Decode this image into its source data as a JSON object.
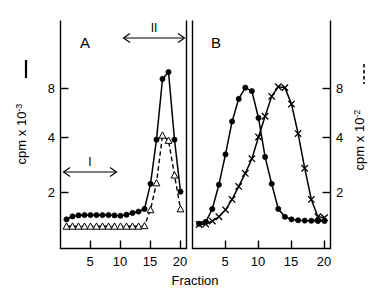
{
  "figure": {
    "x_axis_label": "Fraction",
    "left_y_axis_label": "cpm x 10",
    "left_y_axis_exponent": "-3",
    "right_y_axis_label": "cpm x 10",
    "right_y_axis_exponent": "-2",
    "panel_a_label": "A",
    "panel_b_label": "B",
    "region_i_label": "I",
    "region_ii_label": "II"
  },
  "axis_ticks": {
    "x_labels": [
      "5",
      "10",
      "15",
      "20"
    ],
    "x_values": [
      5,
      10,
      15,
      20
    ],
    "left_y_labels": [
      "2",
      "4",
      "8"
    ],
    "left_y_values": [
      2,
      4,
      8
    ],
    "right_y_labels": [
      "2",
      "4",
      "8"
    ],
    "right_y_values": [
      2,
      4,
      8
    ]
  },
  "chart_data": [
    {
      "type": "line",
      "title": "A",
      "xlabel": "Fraction",
      "ylabel": "cpm x 10^-3",
      "xlim": [
        1,
        21
      ],
      "ylim": [
        0,
        10
      ],
      "grid": false,
      "legend": "none",
      "annotations": [
        {
          "label": "I",
          "type": "double-arrow",
          "x_start": 1,
          "x_end": 10,
          "y": 2.6
        },
        {
          "label": "II",
          "type": "double-arrow",
          "x_start": 14.5,
          "x_end": 21,
          "y": 9.7
        }
      ],
      "series": [
        {
          "name": "solid-filled-circles",
          "marker": "filled-circle",
          "linestyle": "solid",
          "axis": "left",
          "x": [
            1,
            2,
            3,
            4,
            5,
            6,
            7,
            8,
            9,
            10,
            11,
            12,
            13,
            14,
            15,
            16,
            17,
            18,
            19,
            20
          ],
          "values": [
            0.45,
            0.62,
            0.68,
            0.7,
            0.7,
            0.7,
            0.7,
            0.7,
            0.68,
            0.66,
            0.72,
            0.82,
            0.9,
            1.05,
            2.5,
            5.05,
            8.55,
            8.95,
            5.05,
            2.05
          ]
        },
        {
          "name": "dashed-open-triangles",
          "marker": "open-triangle",
          "linestyle": "dashed",
          "axis": "right",
          "x": [
            1,
            2,
            3,
            4,
            5,
            6,
            7,
            8,
            9,
            10,
            11,
            12,
            13,
            14,
            15,
            16,
            17,
            18,
            19,
            20
          ],
          "values": [
            0.05,
            0.05,
            0.05,
            0.05,
            0.05,
            0.05,
            0.05,
            0.05,
            0.05,
            0.05,
            0.05,
            0.05,
            0.05,
            0.08,
            1.0,
            2.55,
            5.3,
            5.0,
            3.0,
            1.05
          ]
        }
      ]
    },
    {
      "type": "line",
      "title": "B",
      "xlabel": "Fraction",
      "ylabel": "cpm x 10^-2",
      "xlim": [
        1,
        21
      ],
      "ylim": [
        0,
        10
      ],
      "grid": false,
      "legend": "none",
      "annotations": [],
      "series": [
        {
          "name": "solid-filled-circles",
          "marker": "filled-circle",
          "linestyle": "solid",
          "axis": "left",
          "x": [
            1,
            2,
            3,
            4,
            5,
            6,
            7,
            8,
            9,
            10,
            11,
            12,
            13,
            14,
            15,
            16,
            17,
            18,
            19,
            20
          ],
          "values": [
            0.2,
            0.3,
            1.05,
            2.45,
            4.2,
            6.1,
            7.4,
            8.05,
            7.85,
            6.3,
            4.05,
            2.5,
            1.05,
            0.6,
            0.45,
            0.4,
            0.38,
            0.37,
            0.36,
            0.36
          ]
        },
        {
          "name": "solid-crosses",
          "marker": "cross",
          "linestyle": "solid",
          "axis": "right",
          "x": [
            1,
            2,
            3,
            4,
            5,
            6,
            7,
            8,
            9,
            10,
            11,
            12,
            13,
            14,
            15,
            16,
            17,
            18,
            19,
            20
          ],
          "values": [
            0.15,
            0.18,
            0.35,
            0.6,
            1.0,
            1.6,
            2.35,
            3.1,
            3.95,
            5.2,
            6.4,
            7.55,
            8.1,
            8.05,
            7.1,
            5.4,
            3.4,
            1.6,
            0.6,
            0.55
          ]
        }
      ]
    }
  ]
}
